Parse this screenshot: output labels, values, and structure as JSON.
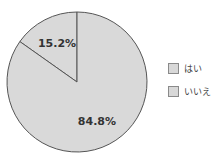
{
  "chart_data": {
    "type": "pie",
    "title": "",
    "categories": [
      "はい",
      "いいえ"
    ],
    "values": [
      15.2,
      84.8
    ],
    "labels": [
      "15.2%",
      "84.8%"
    ],
    "colors": [
      "#d9d9d9",
      "#d9d9d9"
    ],
    "edge_color": "#555555",
    "start_angle_deg": 90,
    "direction": "counterclockwise",
    "legend": {
      "position": "right",
      "entries": [
        "はい",
        "いいえ"
      ]
    }
  }
}
